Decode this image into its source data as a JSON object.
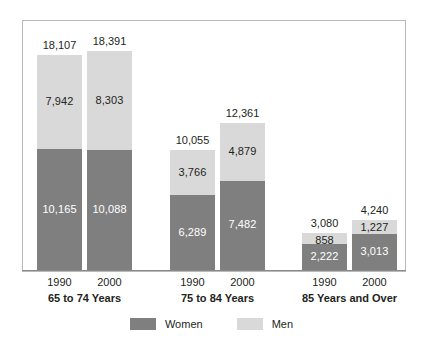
{
  "chart_data": {
    "type": "bar",
    "subtype": "stacked-bar-grouped",
    "title": "",
    "subtitle": "",
    "xlabel": "",
    "ylabel": "",
    "grid": false,
    "ylim": [
      0,
      19500
    ],
    "legend_position": "bottom-center",
    "categories": [
      "1990",
      "2000",
      "1990",
      "2000",
      "1990",
      "2000"
    ],
    "groups": [
      {
        "label": "65 to 74 Years",
        "bars": [
          {
            "year": "1990",
            "women": 10165,
            "men": 7942,
            "total": 18107,
            "women_label": "10,165",
            "men_label": "7,942",
            "total_label": "18,107"
          },
          {
            "year": "2000",
            "women": 10088,
            "men": 8303,
            "total": 18391,
            "women_label": "10,088",
            "men_label": "8,303",
            "total_label": "18,391"
          }
        ]
      },
      {
        "label": "75 to 84 Years",
        "bars": [
          {
            "year": "1990",
            "women": 6289,
            "men": 3766,
            "total": 10055,
            "women_label": "6,289",
            "men_label": "3,766",
            "total_label": "10,055"
          },
          {
            "year": "2000",
            "women": 7482,
            "men": 4879,
            "total": 12361,
            "women_label": "7,482",
            "men_label": "4,879",
            "total_label": "12,361"
          }
        ]
      },
      {
        "label": "85 Years and Over",
        "bars": [
          {
            "year": "1990",
            "women": 2222,
            "men": 858,
            "total": 3080,
            "women_label": "2,222",
            "men_label": "858",
            "total_label": "3,080"
          },
          {
            "year": "2000",
            "women": 3013,
            "men": 1227,
            "total": 4240,
            "women_label": "3,013",
            "men_label": "1,227",
            "total_label": "4,240"
          }
        ]
      }
    ],
    "series": [
      {
        "name": "Women",
        "values": [
          10165,
          10088,
          6289,
          7482,
          2222,
          3013
        ],
        "color": "#7f7f7f"
      },
      {
        "name": "Men",
        "values": [
          7942,
          8303,
          3766,
          4879,
          858,
          1227
        ],
        "color": "#d9d9d9"
      }
    ],
    "totals": [
      18107,
      18391,
      10055,
      12361,
      3080,
      4240
    ]
  },
  "legend": {
    "entries": [
      {
        "label": "Women",
        "color": "#7f7f7f",
        "swatch_name": "legend-swatch-women"
      },
      {
        "label": "Men",
        "color": "#d9d9d9",
        "swatch_name": "legend-swatch-men"
      }
    ]
  },
  "colors": {
    "women": "#7f7f7f",
    "men": "#d9d9d9",
    "frame": "#b9b9b9",
    "axis": "#8a8a8a",
    "text": "#231f20",
    "background": "#ffffff"
  },
  "layout": {
    "bar_width": 45,
    "bar_gap": 5,
    "baseline_y": 270,
    "plot_top": 20,
    "group_x_starts": [
      37,
      170,
      302
    ]
  }
}
